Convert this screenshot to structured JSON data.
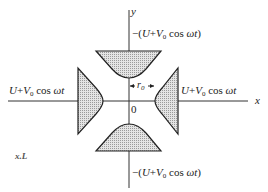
{
  "diagram": {
    "axes": {
      "x_label": "x",
      "y_label": "y",
      "origin_label": "0"
    },
    "electrodes": {
      "top_label": "−(U+V0 cos ωt)",
      "bottom_label": "−(U+V0 cos ωt)",
      "left_label": "U+V0 cos ωt",
      "right_label": "U+V0 cos ωt"
    },
    "radius_label": "r0",
    "corner_mark": "x.L",
    "colors": {
      "stroke": "#222222",
      "fill": "#cfcfcf",
      "background": "#ffffff"
    }
  }
}
